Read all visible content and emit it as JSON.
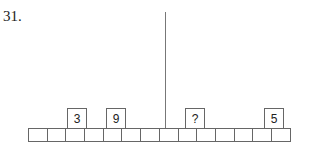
{
  "question": {
    "number": "31."
  },
  "diagram": {
    "cell_count": 14,
    "boxes": [
      {
        "label": "3",
        "cell_index": 2
      },
      {
        "label": "9",
        "cell_index": 4
      },
      {
        "label": "?",
        "cell_index": 8
      },
      {
        "label": "5",
        "cell_index": 12
      }
    ],
    "divider_after_cell": 6
  }
}
